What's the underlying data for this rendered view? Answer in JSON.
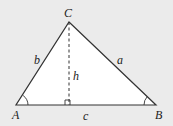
{
  "diagram": {
    "type": "triangle-altitude",
    "background": "#ebebeb",
    "fill": "#ffffff",
    "stroke": "#333333",
    "vertices": {
      "A": {
        "label": "A",
        "x": 16,
        "y": 105
      },
      "B": {
        "label": "B",
        "x": 156,
        "y": 105
      },
      "C": {
        "label": "C",
        "x": 69,
        "y": 22
      }
    },
    "sides": {
      "a": {
        "label": "a"
      },
      "b": {
        "label": "b"
      },
      "c": {
        "label": "c"
      }
    },
    "altitude": {
      "label": "h",
      "style": "dashed",
      "foot_x": 69
    },
    "markers": [
      "angle-arc-A",
      "angle-arc-B",
      "right-angle-at-foot"
    ]
  }
}
